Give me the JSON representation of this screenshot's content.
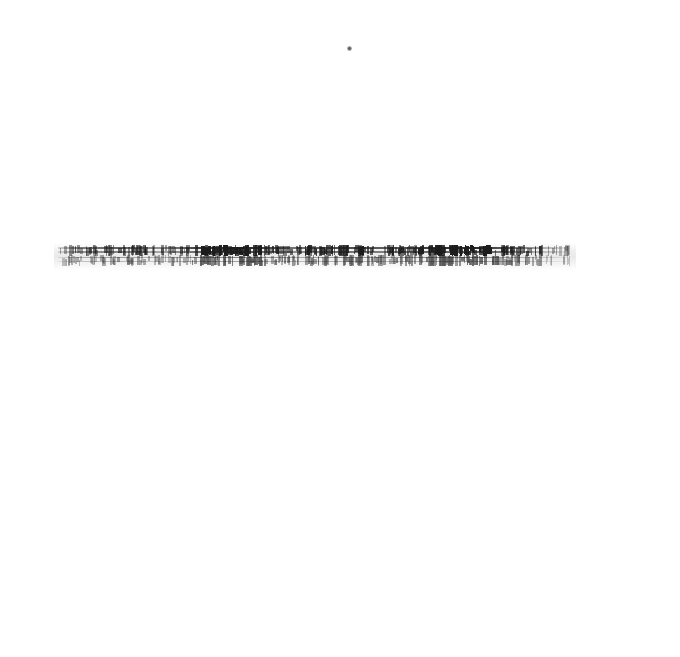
{
  "document": {
    "page_background": "#ffffff",
    "ink_color": "#1c1c1c",
    "condition": "severely degraded scan, text illegible",
    "page_width": 680,
    "page_height": 657
  },
  "artifacts": {
    "speck": {
      "name": "isolated-scan-speck",
      "x": 347,
      "y": 46,
      "size": 5,
      "color": "#4a4a4a"
    }
  },
  "text_band": {
    "label": "degraded-text-line",
    "x": 58,
    "y": 243,
    "width": 514,
    "height": 27,
    "line_count": 2,
    "legible_text": "",
    "transcription": "[illegible]",
    "lines": [
      {
        "id": "upper",
        "opacity": 1.0,
        "transcription": "[illegible]"
      },
      {
        "id": "lower",
        "opacity": 0.72,
        "transcription": "[illegible]"
      }
    ],
    "density_profile": [
      {
        "from_pct": 0,
        "to_pct": 8,
        "density": 0.35
      },
      {
        "from_pct": 8,
        "to_pct": 18,
        "density": 0.5
      },
      {
        "from_pct": 18,
        "to_pct": 26,
        "density": 0.4
      },
      {
        "from_pct": 26,
        "to_pct": 40,
        "density": 0.9
      },
      {
        "from_pct": 40,
        "to_pct": 48,
        "density": 0.55
      },
      {
        "from_pct": 48,
        "to_pct": 60,
        "density": 0.75
      },
      {
        "from_pct": 60,
        "to_pct": 70,
        "density": 0.6
      },
      {
        "from_pct": 70,
        "to_pct": 86,
        "density": 0.92
      },
      {
        "from_pct": 86,
        "to_pct": 95,
        "density": 0.6
      },
      {
        "from_pct": 95,
        "to_pct": 100,
        "density": 0.2
      }
    ]
  }
}
